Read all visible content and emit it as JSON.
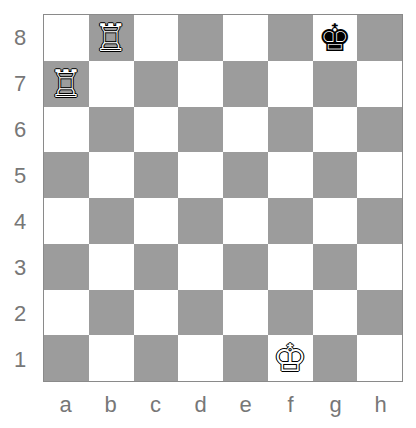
{
  "board": {
    "colors": {
      "light": "#ffffff",
      "dark": "#9c9c9c",
      "label": "#777777"
    },
    "ranks": [
      "8",
      "7",
      "6",
      "5",
      "4",
      "3",
      "2",
      "1"
    ],
    "files": [
      "a",
      "b",
      "c",
      "d",
      "e",
      "f",
      "g",
      "h"
    ],
    "pieces": [
      {
        "square": "b8",
        "type": "rook",
        "color": "white",
        "glyph": "♖"
      },
      {
        "square": "a7",
        "type": "rook",
        "color": "white",
        "glyph": "♖"
      },
      {
        "square": "g8",
        "type": "king",
        "color": "black",
        "glyph": "♚"
      },
      {
        "square": "f1",
        "type": "king",
        "color": "white",
        "glyph": "♔"
      }
    ]
  }
}
